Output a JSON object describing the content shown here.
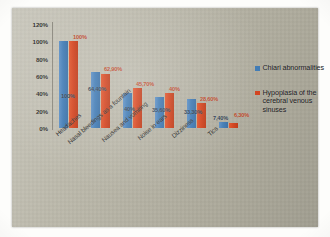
{
  "chart_data": {
    "type": "bar",
    "title": "",
    "xlabel": "",
    "ylabel": "",
    "ylim": [
      0,
      120
    ],
    "grid": false,
    "legend_position": "right",
    "yticks": [
      "120%",
      "100%",
      "80%",
      "60%",
      "40%",
      "20%",
      "0%"
    ],
    "categories": [
      "Headaches",
      "Nasal bleedings as a fountain",
      "Nausea and vomiting",
      "Noise in ears",
      "Dizziness",
      "Tics"
    ],
    "series": [
      {
        "name": "Chiari abnormalities",
        "color": "#3f7ab4",
        "values": [
          100,
          64.4,
          40,
          35.6,
          33.3,
          7.4
        ],
        "labels": [
          "100%",
          "64,40%",
          "40%",
          "35,60%",
          "33,30%",
          "7,40%"
        ]
      },
      {
        "name": "Hypoplasia of the cerebral venous sinuses",
        "color": "#d2411c",
        "values": [
          100,
          62.9,
          45.7,
          40,
          28.6,
          6.3
        ],
        "labels": [
          "100%",
          "62,90%",
          "45,70%",
          "40%",
          "28,60%",
          "6,30%"
        ]
      }
    ]
  },
  "legend": {
    "items": [
      {
        "label": "Chiari abnormalities",
        "color": "#3f7ab4"
      },
      {
        "label": "Hypoplasia of the cerebral venous sinuses",
        "color": "#d2411c"
      }
    ]
  }
}
